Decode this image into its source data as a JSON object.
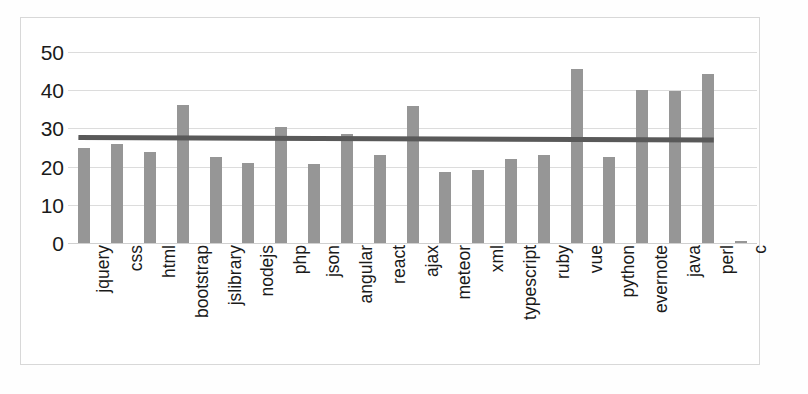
{
  "chart_data": {
    "type": "bar",
    "title": "",
    "subtitle": "",
    "xlabel": "",
    "ylabel": "",
    "ylim": [
      0,
      55
    ],
    "yticks": [
      0,
      10,
      20,
      30,
      40,
      50
    ],
    "ytick_labels": [
      "0",
      "10",
      "20",
      "30",
      "40",
      "50"
    ],
    "grid": true,
    "legend": "none",
    "bar_color": "#969696",
    "trendline_color": "#595959",
    "gridline_color": "#dcdcdc",
    "categories": [
      "jquery",
      "css",
      "html",
      "bootstrap",
      "jslibrary",
      "nodejs",
      "php",
      "json",
      "angular",
      "react",
      "ajax",
      "meteor",
      "xml",
      "typescript",
      "ruby",
      "vue",
      "python",
      "evernote",
      "java",
      "perl",
      "c"
    ],
    "values": [
      25.0,
      26.0,
      23.8,
      36.2,
      22.5,
      21.0,
      30.5,
      20.6,
      28.5,
      23.1,
      36.0,
      18.7,
      19.0,
      22.0,
      23.0,
      45.5,
      22.5,
      40.0,
      39.7,
      44.2,
      0.5
    ],
    "series": [
      {
        "name": "values",
        "values": [
          25.0,
          26.0,
          23.8,
          36.2,
          22.5,
          21.0,
          30.5,
          20.6,
          28.5,
          23.1,
          36.0,
          18.7,
          19.0,
          22.0,
          23.0,
          45.5,
          22.5,
          40.0,
          39.7,
          44.2,
          0.5
        ]
      },
      {
        "name": "trendline",
        "type": "line",
        "start_value": 27.6,
        "end_value": 27.0,
        "spans_categories": [
          "jquery",
          "perl"
        ]
      }
    ],
    "annotations": []
  }
}
